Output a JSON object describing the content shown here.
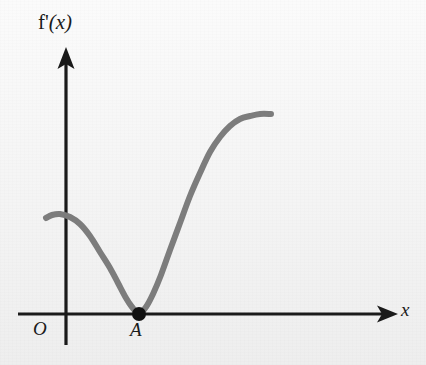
{
  "figure": {
    "kind": "coordinate-graph",
    "background_color": "#f4f4f4"
  },
  "labels": {
    "y_axis_function": "f'",
    "y_axis_variable": "(x)",
    "y_axis_full": "f'(x)",
    "x_axis": "x",
    "origin": "O",
    "point_a": "A"
  },
  "colors": {
    "axis": "#1a1a1a",
    "curve": "#7d7d7d",
    "point": "#111111",
    "text": "#1b1b1b",
    "background": "#f4f4f4"
  },
  "chart_data": {
    "type": "line",
    "title": "",
    "xlabel": "x",
    "ylabel": "f'(x)",
    "grid": false,
    "legend": null,
    "axes": {
      "x_axis_y_pixel": 314,
      "y_axis_x_pixel": 66,
      "x_axis_start_pixel": 18,
      "x_axis_end_pixel": 398,
      "y_axis_top_pixel": 50,
      "y_axis_bottom_pixel": 345,
      "x_arrow": true,
      "y_arrow": true,
      "tick_labels_x": [],
      "tick_labels_y": []
    },
    "annotations": [
      {
        "name": "point-a",
        "label": "A",
        "x_pixel": 139,
        "y_pixel": 314,
        "marker": "filled-circle",
        "radius": 7,
        "note": "curve touches x-axis tangentially (double root)"
      },
      {
        "name": "origin",
        "label": "O",
        "x_pixel": 66,
        "y_pixel": 314,
        "marker": "none"
      }
    ],
    "series": [
      {
        "name": "f'(x)",
        "color": "#7d7d7d",
        "width": 6,
        "points_pixel": [
          [
            46,
            218
          ],
          [
            52,
            215
          ],
          [
            60,
            214
          ],
          [
            70,
            217
          ],
          [
            80,
            224
          ],
          [
            90,
            236
          ],
          [
            100,
            252
          ],
          [
            110,
            268
          ],
          [
            118,
            283
          ],
          [
            126,
            298
          ],
          [
            132,
            307
          ],
          [
            139,
            314
          ],
          [
            146,
            307
          ],
          [
            153,
            294
          ],
          [
            161,
            275
          ],
          [
            170,
            250
          ],
          [
            180,
            223
          ],
          [
            190,
            196
          ],
          [
            200,
            173
          ],
          [
            210,
            152
          ],
          [
            220,
            137
          ],
          [
            230,
            126
          ],
          [
            240,
            119
          ],
          [
            250,
            116
          ],
          [
            260,
            114
          ],
          [
            271,
            114
          ]
        ],
        "shape_description": "Starts above x-axis at a local maximum just left of the y-axis, decreases to touch the x-axis tangentially at A, then increases steeply and levels off to a plateau on the right."
      }
    ],
    "xlim_pixel": [
      18,
      398
    ],
    "ylim_pixel": [
      50,
      345
    ]
  }
}
